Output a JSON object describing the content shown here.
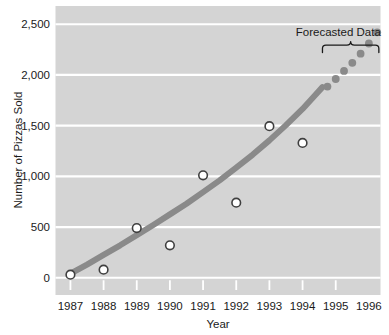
{
  "chart_data": {
    "type": "scatter",
    "title": "",
    "xlabel": "Year",
    "ylabel": "Number of Pizzas Sold",
    "x": [
      1987,
      1988,
      1989,
      1990,
      1991,
      1992,
      1993,
      1994,
      1995,
      1996
    ],
    "xticklabels": [
      "1987",
      "1988",
      "1989",
      "1990",
      "1991",
      "1992",
      "1993",
      "1994",
      "1995",
      "1996"
    ],
    "yticklabels": [
      "0",
      "500",
      "1,000",
      "1,500",
      "2,000",
      "2,500"
    ],
    "yticks": [
      0,
      500,
      1000,
      1500,
      2000,
      2500
    ],
    "ylim": [
      -170,
      2680
    ],
    "xlim": [
      1986.55,
      1996.35
    ],
    "grid": "horizontal-only",
    "legend": "none",
    "plot_bgcolor": "#d4d4d4",
    "gridline_color": "#ffffff",
    "series": [
      {
        "name": "Observed Data",
        "type": "scatter",
        "marker": "open-circle",
        "marker_facecolor": "#ffffff",
        "marker_edgecolor": "#3f3f3f",
        "points": [
          {
            "x": 1987,
            "y": 30
          },
          {
            "x": 1988,
            "y": 80
          },
          {
            "x": 1989,
            "y": 490
          },
          {
            "x": 1990,
            "y": 320
          },
          {
            "x": 1991,
            "y": 1010
          },
          {
            "x": 1992,
            "y": 740
          },
          {
            "x": 1993,
            "y": 1495
          },
          {
            "x": 1994,
            "y": 1330
          }
        ]
      },
      {
        "name": "Trend Curve",
        "type": "line",
        "color": "#8a8a8a",
        "linewidth": 6,
        "points": [
          {
            "x": 1987.0,
            "y": 40
          },
          {
            "x": 1987.5,
            "y": 130
          },
          {
            "x": 1988.0,
            "y": 225
          },
          {
            "x": 1988.5,
            "y": 320
          },
          {
            "x": 1989.0,
            "y": 420
          },
          {
            "x": 1989.5,
            "y": 520
          },
          {
            "x": 1990.0,
            "y": 625
          },
          {
            "x": 1990.5,
            "y": 730
          },
          {
            "x": 1991.0,
            "y": 845
          },
          {
            "x": 1991.5,
            "y": 960
          },
          {
            "x": 1992.0,
            "y": 1085
          },
          {
            "x": 1992.5,
            "y": 1215
          },
          {
            "x": 1993.0,
            "y": 1355
          },
          {
            "x": 1993.5,
            "y": 1505
          },
          {
            "x": 1994.0,
            "y": 1665
          },
          {
            "x": 1994.35,
            "y": 1790
          },
          {
            "x": 1994.6,
            "y": 1880
          }
        ]
      },
      {
        "name": "Forecasted Data",
        "type": "scatter",
        "marker": "filled-circle",
        "marker_facecolor": "#8a8a8a",
        "points": [
          {
            "x": 1994.75,
            "y": 1885
          },
          {
            "x": 1995.0,
            "y": 1960
          },
          {
            "x": 1995.25,
            "y": 2040
          },
          {
            "x": 1995.5,
            "y": 2120
          },
          {
            "x": 1995.75,
            "y": 2210
          },
          {
            "x": 1996.0,
            "y": 2310
          },
          {
            "x": 1996.25,
            "y": 2420
          }
        ]
      }
    ],
    "annotations": [
      {
        "name": "forecasted-data-bracket",
        "label": "Forecasted Data",
        "type": "curly-brace",
        "x_start": 1994.6,
        "x_end": 1996.3
      }
    ]
  },
  "labels": {
    "y_axis_title": "Number of Pizzas Sold",
    "x_axis_title": "Year",
    "forecast_annotation": "Forecasted Data",
    "y_0": "0",
    "y_500": "500",
    "y_1000": "1,000",
    "y_1500": "1,500",
    "y_2000": "2,000",
    "y_2500": "2,500",
    "x_1987": "1987",
    "x_1988": "1988",
    "x_1989": "1989",
    "x_1990": "1990",
    "x_1991": "1991",
    "x_1992": "1992",
    "x_1993": "1993",
    "x_1994": "1994",
    "x_1995": "1995",
    "x_1996": "1996"
  }
}
